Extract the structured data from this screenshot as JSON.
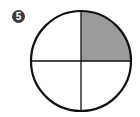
{
  "badge": {
    "number": "5"
  },
  "diagram": {
    "shape": "circle",
    "parts": 4,
    "shaded_parts": 1,
    "shaded_quadrant": "top-right",
    "fraction_shaded": "1/4",
    "colors": {
      "stroke": "#111111",
      "shade": "#9b9b9b",
      "fill": "#ffffff"
    }
  }
}
